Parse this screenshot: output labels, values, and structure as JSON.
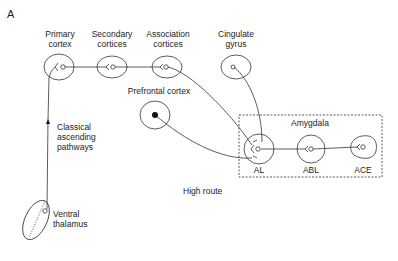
{
  "panel_label": "A",
  "nodes": {
    "primary_cortex": {
      "line1": "Primary",
      "line2": "cortex"
    },
    "secondary_cortices": {
      "line1": "Secondary",
      "line2": "cortices"
    },
    "association_cortices": {
      "line1": "Association",
      "line2": "cortices"
    },
    "cingulate_gyrus": {
      "line1": "Cingulate",
      "line2": "gyrus"
    },
    "prefrontal_cortex": {
      "label": "Prefrontal cortex"
    },
    "ventral_thalamus": {
      "line1": "Ventral",
      "line2": "thalamus"
    },
    "al": {
      "label": "AL"
    },
    "abl": {
      "label": "ABL"
    },
    "ace": {
      "label": "ACE"
    }
  },
  "amygdala_box": {
    "label": "Amygdala"
  },
  "pathway_labels": {
    "classical_line1": "Classical",
    "classical_line2": "ascending",
    "classical_line3": "pathways",
    "high_route": "High route"
  },
  "colors": {
    "stroke": "#333333",
    "text": "#222222",
    "background": "#ffffff"
  }
}
